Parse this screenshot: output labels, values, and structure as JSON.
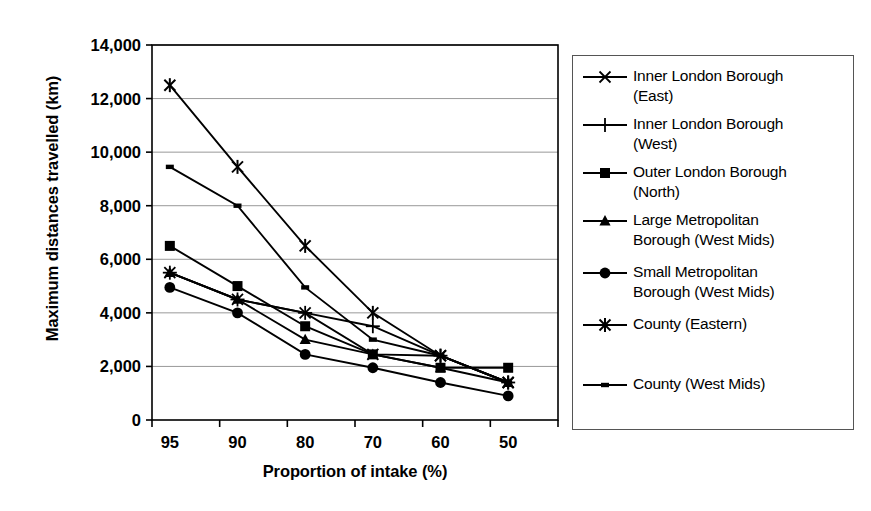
{
  "chart_data": {
    "type": "line",
    "title": "",
    "xlabel": "Proportion of intake (%)",
    "ylabel": "Maximum distances travelled (km)",
    "categories": [
      "95",
      "90",
      "80",
      "70",
      "60",
      "50"
    ],
    "ytick_labels": [
      "0",
      "2,000",
      "4,000",
      "6,000",
      "8,000",
      "10,000",
      "12,000",
      "14,000"
    ],
    "ytick_values": [
      0,
      2000,
      4000,
      6000,
      8000,
      10000,
      12000,
      14000
    ],
    "ylim": [
      0,
      14000
    ],
    "grid": "horizontal",
    "legend_position": "right",
    "series": [
      {
        "name": "Inner London Borough (East)",
        "label": "Inner London Borough\n(East)",
        "marker": "x-cross-marker",
        "values": [
          5500,
          4500,
          4000,
          2450,
          2400,
          1400
        ]
      },
      {
        "name": "Inner London Borough (West)",
        "label": "Inner London Borough\n(West)",
        "marker": "plus-marker",
        "values": [
          5500,
          4500,
          4000,
          3500,
          2400,
          1400
        ]
      },
      {
        "name": "Outer London Borough (North)",
        "label": "Outer London Borough\n(North)",
        "marker": "square-marker",
        "values": [
          6500,
          5000,
          3500,
          2450,
          1950,
          1950
        ]
      },
      {
        "name": "Large Metropolitan Borough (West Mids)",
        "label": "Large Metropolitan\nBorough (West Mids)",
        "marker": "triangle-marker",
        "values": [
          5500,
          4500,
          3000,
          2450,
          1950,
          1400
        ]
      },
      {
        "name": "Small Metropolitan Borough (West Mids)",
        "label": "Small Metropolitan\nBorough (West Mids)",
        "marker": "circle-marker",
        "values": [
          4950,
          4000,
          2450,
          1950,
          1400,
          900
        ]
      },
      {
        "name": "County (Eastern)",
        "label": "County (Eastern)",
        "marker": "asterisk-marker",
        "values": [
          12500,
          9450,
          6500,
          4000,
          2400,
          1400
        ]
      },
      {
        "name": "County (West Mids)",
        "label": "County (West Mids)",
        "marker": "small-dash-marker",
        "values": [
          9450,
          8000,
          4950,
          3000,
          2400,
          1400
        ]
      }
    ],
    "colors": {
      "line": "#000000",
      "marker": "#000000",
      "grid": "#999999",
      "axis": "#000000",
      "background": "#ffffff"
    }
  }
}
